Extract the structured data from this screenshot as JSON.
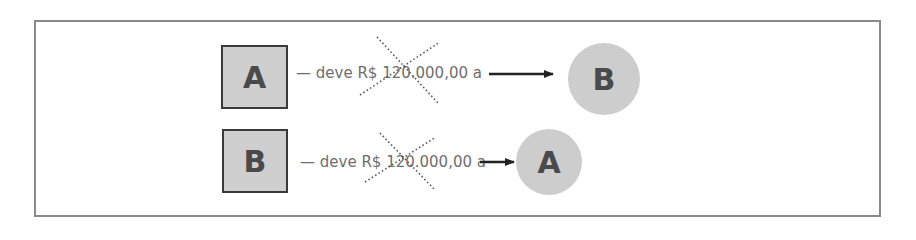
{
  "diagram": {
    "rows": [
      {
        "source": {
          "label": "A",
          "shape": "square"
        },
        "relation": "— deve R$ 120.000,00 a",
        "target": {
          "label": "B",
          "shape": "circle"
        },
        "crossed_out": true
      },
      {
        "source": {
          "label": "B",
          "shape": "square"
        },
        "relation": "— deve R$ 120.000,00 a",
        "target": {
          "label": "A",
          "shape": "circle"
        },
        "crossed_out": true
      }
    ],
    "colors": {
      "frame_border": "#8a8a8a",
      "node_fill": "#cdcdcd",
      "node_border": "#3a3a3a",
      "node_text": "#4a4a4a",
      "label_text": "#6e6e6e",
      "arrow": "#222222",
      "cross": "#555555"
    }
  }
}
